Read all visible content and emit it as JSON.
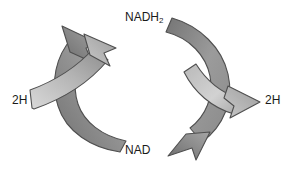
{
  "diagram": {
    "background_color": "#ffffff",
    "text_color": "#1a1a1a",
    "arrow_fill_light": "#d5d5d5",
    "arrow_fill_mid": "#9a9a9a",
    "arrow_fill_dark": "#6e6e6e",
    "arrow_outline": "#4a4a4a",
    "labels": {
      "top": "NADH",
      "top_subscript": "2",
      "bottom": "NAD",
      "left_input": "2H",
      "right_output": "2H"
    },
    "nodes": [
      {
        "id": "nadh2",
        "label": "NADH2",
        "position": "top"
      },
      {
        "id": "nad",
        "label": "NAD",
        "position": "bottom"
      },
      {
        "id": "h-in",
        "label": "2H",
        "position": "left"
      },
      {
        "id": "h-out",
        "label": "2H",
        "position": "right"
      }
    ],
    "arrows": [
      {
        "id": "reduction-arc",
        "from": "NAD",
        "to": "NADH2",
        "side": "left",
        "direction": "up"
      },
      {
        "id": "hydrogen-input",
        "from": "2H",
        "to": "NADH2",
        "side": "left",
        "direction": "up-right"
      },
      {
        "id": "oxidation-arc",
        "from": "NADH2",
        "to": "NAD",
        "side": "right",
        "direction": "down"
      },
      {
        "id": "hydrogen-output",
        "from": "NADH2",
        "to": "2H",
        "side": "right",
        "direction": "right"
      }
    ]
  }
}
